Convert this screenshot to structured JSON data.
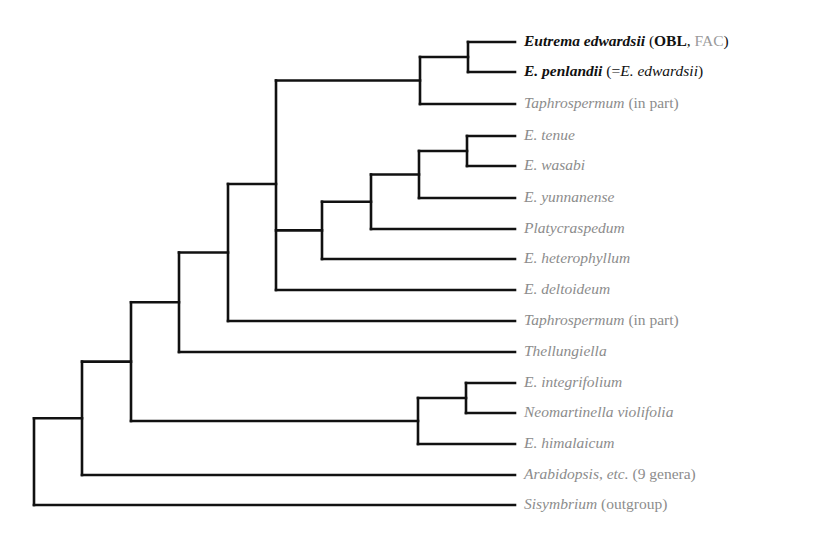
{
  "tree": {
    "stroke_color": "#111111",
    "stroke_width": 2.6,
    "label_color": "#8c8c8c",
    "highlight_color": "#111111",
    "leaf_x": 515,
    "leaves": [
      {
        "id": "eutrema",
        "y": 42,
        "highlight": true,
        "parts": [
          {
            "t": "Eutrema edwardsii",
            "c": "sp"
          },
          {
            "t": " ("
          },
          {
            "t": "OBL",
            "c": "b"
          },
          {
            "t": ", "
          },
          {
            "t": "FAC",
            "c": "gray"
          },
          {
            "t": ")"
          }
        ]
      },
      {
        "id": "penlandii",
        "y": 72,
        "highlight": true,
        "parts": [
          {
            "t": "E. penlandii",
            "c": "sp"
          },
          {
            "t": " (="
          },
          {
            "t": "E. edwardsii",
            "c": "it"
          },
          {
            "t": ")"
          }
        ]
      },
      {
        "id": "taphro1",
        "y": 104,
        "highlight": false,
        "parts": [
          {
            "t": "Taphrospermum",
            "c": "sp"
          },
          {
            "t": " (in part)"
          }
        ]
      },
      {
        "id": "tenue",
        "y": 136,
        "highlight": false,
        "parts": [
          {
            "t": "E. tenue",
            "c": "sp"
          }
        ]
      },
      {
        "id": "wasabi",
        "y": 166,
        "highlight": false,
        "parts": [
          {
            "t": "E. wasabi",
            "c": "sp"
          }
        ]
      },
      {
        "id": "yunnan",
        "y": 198,
        "highlight": false,
        "parts": [
          {
            "t": "E. yunnanense",
            "c": "sp"
          }
        ]
      },
      {
        "id": "platy",
        "y": 229,
        "highlight": false,
        "parts": [
          {
            "t": "Platycraspedum",
            "c": "sp"
          }
        ]
      },
      {
        "id": "hetero",
        "y": 259,
        "highlight": false,
        "parts": [
          {
            "t": "E. heterophyllum",
            "c": "sp"
          }
        ]
      },
      {
        "id": "delto",
        "y": 290,
        "highlight": false,
        "parts": [
          {
            "t": "E. deltoideum",
            "c": "sp"
          }
        ]
      },
      {
        "id": "taphro2",
        "y": 321,
        "highlight": false,
        "parts": [
          {
            "t": "Taphrospermum",
            "c": "sp"
          },
          {
            "t": " (in part)"
          }
        ]
      },
      {
        "id": "thell",
        "y": 352,
        "highlight": false,
        "parts": [
          {
            "t": "Thellungiella",
            "c": "sp"
          }
        ]
      },
      {
        "id": "integ",
        "y": 383,
        "highlight": false,
        "parts": [
          {
            "t": "E. integrifolium",
            "c": "sp"
          }
        ]
      },
      {
        "id": "neomar",
        "y": 413,
        "highlight": false,
        "parts": [
          {
            "t": "Neomartinella violifolia",
            "c": "sp"
          }
        ]
      },
      {
        "id": "himal",
        "y": 444,
        "highlight": false,
        "parts": [
          {
            "t": "E. himalaicum",
            "c": "sp"
          }
        ]
      },
      {
        "id": "arabid",
        "y": 475,
        "highlight": false,
        "parts": [
          {
            "t": "Arabidopsis, etc.",
            "c": "sp"
          },
          {
            "t": " (9 genera)"
          }
        ]
      },
      {
        "id": "sisym",
        "y": 505,
        "highlight": false,
        "parts": [
          {
            "t": "Sisymbrium",
            "c": "sp"
          },
          {
            "t": " (outgroup)"
          }
        ]
      }
    ],
    "nodes": [
      {
        "id": "n_ep",
        "x": 468,
        "children": [
          "eutrema",
          "penlandii"
        ]
      },
      {
        "id": "n_ept",
        "x": 420,
        "children": [
          "n_ep",
          "taphro1"
        ]
      },
      {
        "id": "n_tw",
        "x": 467,
        "children": [
          "tenue",
          "wasabi"
        ]
      },
      {
        "id": "n_twy",
        "x": 419,
        "children": [
          "n_tw",
          "yunnan"
        ]
      },
      {
        "id": "n_twyp",
        "x": 371,
        "children": [
          "n_twy",
          "platy"
        ]
      },
      {
        "id": "n_h",
        "x": 322,
        "children": [
          "n_twyp",
          "hetero"
        ]
      },
      {
        "id": "n_big",
        "x": 276,
        "children": [
          "n_ept",
          "n_h",
          "delto"
        ]
      },
      {
        "id": "n_t2",
        "x": 228,
        "children": [
          "n_big",
          "taphro2"
        ]
      },
      {
        "id": "n_th",
        "x": 179,
        "children": [
          "n_t2",
          "thell"
        ]
      },
      {
        "id": "n_in",
        "x": 466,
        "children": [
          "integ",
          "neomar"
        ]
      },
      {
        "id": "n_inh",
        "x": 418,
        "children": [
          "n_in",
          "himal"
        ]
      },
      {
        "id": "n_mid",
        "x": 131,
        "children": [
          "n_th",
          "n_inh"
        ]
      },
      {
        "id": "n_ar",
        "x": 82,
        "children": [
          "n_mid",
          "arabid"
        ]
      },
      {
        "id": "root",
        "x": 34,
        "children": [
          "n_ar",
          "sisym"
        ]
      }
    ],
    "node_y_overrides": {
      "n_big": 184
    }
  }
}
